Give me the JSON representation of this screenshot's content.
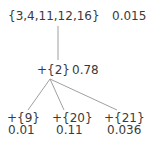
{
  "tree": {
    "root": {
      "label": "{3,4,11,12,16}",
      "value": "0.015"
    },
    "mid": {
      "label": "+{2}",
      "value": "0.78"
    },
    "children": [
      {
        "label": "+{9}",
        "value": "0.01"
      },
      {
        "label": "+{20}",
        "value": "0.11"
      },
      {
        "label": "+{21}",
        "value": "0.036"
      }
    ]
  },
  "colors": {
    "text": "#3a3a3a",
    "edge": "#a0a0a0",
    "background": "#ffffff"
  }
}
